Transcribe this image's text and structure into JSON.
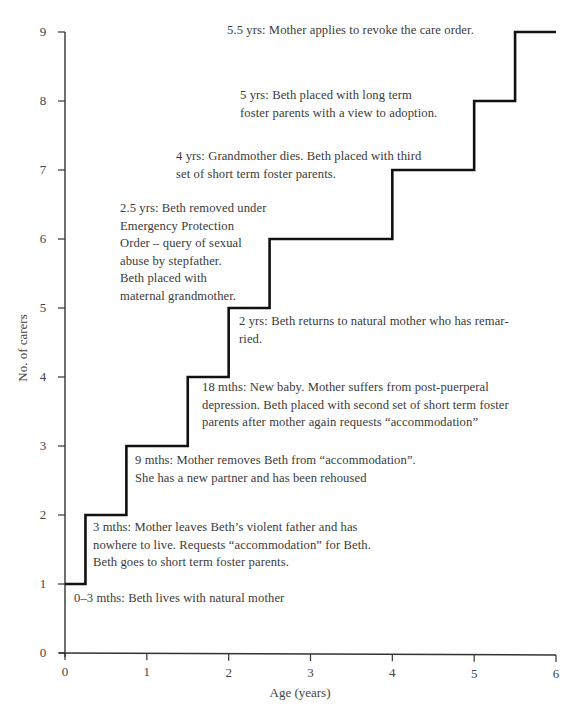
{
  "chart_data": {
    "type": "line",
    "subtype": "step",
    "title": "",
    "xlabel": "Age (years)",
    "ylabel": "No. of carers",
    "xlim": [
      0,
      6
    ],
    "ylim": [
      0,
      9
    ],
    "x_ticks": [
      "0",
      "1",
      "2",
      "3",
      "4",
      "5",
      "6"
    ],
    "y_ticks": [
      "0",
      "1",
      "2",
      "3",
      "4",
      "5",
      "6",
      "7",
      "8",
      "9"
    ],
    "grid": false,
    "legend": null,
    "series": [
      {
        "name": "Number of carers",
        "x": [
          0,
          0.25,
          0.75,
          1.5,
          2.0,
          2.5,
          4.0,
          5.0,
          5.5,
          6.0
        ],
        "values": [
          1,
          2,
          3,
          4,
          5,
          6,
          7,
          8,
          9,
          9
        ]
      }
    ],
    "annotations": [
      {
        "x": 0,
        "y": 1,
        "text": "0–3 mths: Beth lives with natural mother"
      },
      {
        "x": 0.25,
        "y": 2,
        "text": "3 mths: Mother leaves Beth’s violent father and has\nnowhere to live. Requests “accommodation” for Beth.\nBeth goes to short term foster parents."
      },
      {
        "x": 0.75,
        "y": 3,
        "text": "9 mths: Mother removes Beth from “accommodation”.\nShe has a new partner and has been rehoused"
      },
      {
        "x": 1.5,
        "y": 4,
        "text": "18 mths: New baby. Mother suffers from post-puerperal\ndepression. Beth placed with second set of short term foster\nparents after mother again requests “accommodation”"
      },
      {
        "x": 2.0,
        "y": 5,
        "text": "2 yrs: Beth returns to natural mother who has remar-\nried."
      },
      {
        "x": 2.5,
        "y": 6,
        "text": "2.5 yrs: Beth removed under\nEmergency Protection\nOrder – query of sexual\nabuse by stepfather.\nBeth placed with\nmaternal grandmother."
      },
      {
        "x": 4.0,
        "y": 7,
        "text": "4 yrs: Grandmother dies. Beth placed with third\nset of short term foster parents."
      },
      {
        "x": 5.0,
        "y": 8,
        "text": "5 yrs: Beth placed with long term\nfoster parents with a view to adoption."
      },
      {
        "x": 5.5,
        "y": 9,
        "text": "5.5 yrs: Mother applies to revoke the care order."
      }
    ]
  },
  "notes": {
    "n0": "0–3 mths: Beth lives with natural mother",
    "n1": "3 mths: Mother leaves Beth’s violent father and has\nnowhere to live. Requests “accommodation” for Beth.\nBeth goes to short term foster parents.",
    "n2": "9 mths: Mother removes Beth from “accommodation”.\nShe has a new partner and has been rehoused",
    "n3": "18 mths: New baby. Mother suffers from post-puerperal\ndepression. Beth placed with second set of short term foster\nparents after mother again requests “accommodation”",
    "n4": "2 yrs: Beth returns to natural mother who has remar-\nried.",
    "n5": "2.5 yrs: Beth removed under\nEmergency Protection\nOrder – query of sexual\nabuse by stepfather.\nBeth placed with\nmaternal grandmother.",
    "n6": "4 yrs: Grandmother dies. Beth placed with third\nset of short term foster parents.",
    "n7": "5 yrs: Beth placed with long term\nfoster parents with a view to adoption.",
    "n8": "5.5 yrs: Mother applies to revoke the care order."
  },
  "axes": {
    "xlabel": "Age (years)",
    "ylabel": "No. of carers",
    "x_ticks": [
      "0",
      "1",
      "2",
      "3",
      "4",
      "5",
      "6"
    ],
    "y_ticks": [
      "0",
      "1",
      "2",
      "3",
      "4",
      "5",
      "6",
      "7",
      "8",
      "9"
    ]
  },
  "colors": {
    "line": "#111111",
    "axis": "#333333",
    "text": "#3a3a3a"
  }
}
